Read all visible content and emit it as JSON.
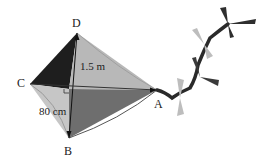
{
  "figure": {
    "vertices": {
      "A": {
        "label": "A",
        "x": 157,
        "y": 90
      },
      "B": {
        "label": "B",
        "x": 69,
        "y": 138
      },
      "C": {
        "label": "C",
        "x": 30,
        "y": 83
      },
      "D": {
        "label": "D",
        "x": 77,
        "y": 33
      }
    },
    "measurements": {
      "upper": "1.5 m",
      "lower": "80 cm"
    },
    "right_angle_marker": true,
    "colors": {
      "panel_cd": "#1e1e1e",
      "panel_da": "#b8b8b8",
      "panel_cb": "#c4c4c4",
      "panel_ba": "#6e6e6e",
      "tail_dark": "#2a2a2a",
      "tail_light": "#bdbdbd"
    }
  }
}
